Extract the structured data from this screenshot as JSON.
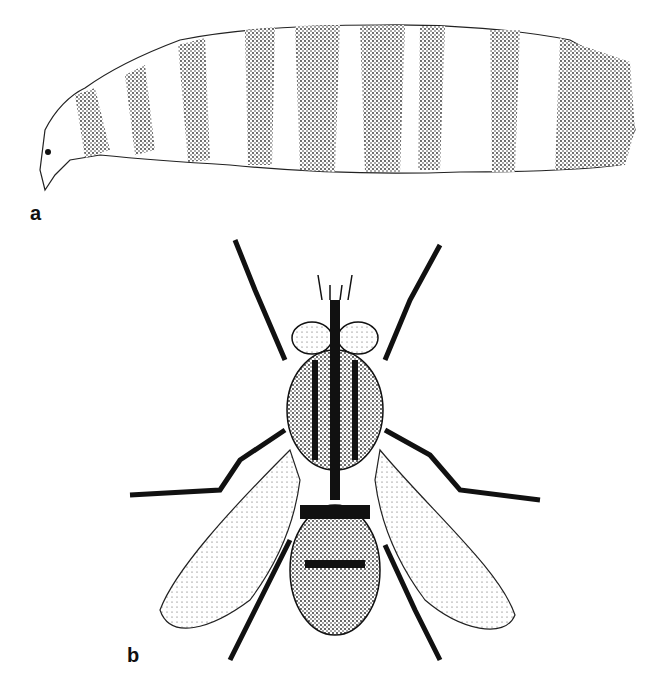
{
  "figure": {
    "panels": [
      {
        "label": "a",
        "subject": "larva (maggot), lateral view, segmented body with stippled bands"
      },
      {
        "label": "b",
        "subject": "adult fly, dorsal view, wings spread"
      }
    ]
  }
}
